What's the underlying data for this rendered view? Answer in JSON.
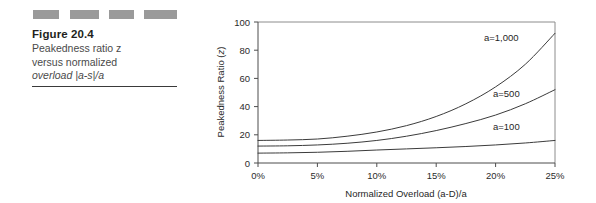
{
  "figure": {
    "redaction_blocks": 4,
    "title": "Figure 20.4",
    "caption_line_1": "Peakedness ratio z",
    "caption_line_2": "versus normalized",
    "caption_line_3": "overload |a-s|/a",
    "caption_full": "Peakedness ratio z versus normalized overload |a-s|/a",
    "rule_color": "#3a3a3a",
    "redaction_color": "#9a9a9a"
  },
  "chart_data": {
    "type": "line",
    "title": "",
    "xlabel": "Normalized Overload (a-D)/a",
    "ylabel": "Peakedness Ratio (z)",
    "ylabel_prefix": "Peakedness Ratio (",
    "ylabel_italic": "z",
    "ylabel_suffix": ")",
    "xlim": [
      0,
      25
    ],
    "ylim": [
      0,
      100
    ],
    "xticks": [
      0,
      5,
      10,
      15,
      20,
      25
    ],
    "xticklabels": [
      "0%",
      "5%",
      "10%",
      "15%",
      "20%",
      "25%"
    ],
    "yticks": [
      0,
      20,
      40,
      60,
      80,
      100
    ],
    "yticklabels": [
      "0",
      "20",
      "40",
      "60",
      "80",
      "100"
    ],
    "grid": false,
    "legend": "inline-annotations",
    "line_color": "#3b3b3b",
    "x": [
      0,
      2.5,
      5,
      7.5,
      10,
      12.5,
      15,
      17.5,
      20,
      22.5,
      25
    ],
    "series": [
      {
        "name": "a=1,000",
        "label": "a=1,000",
        "label_x": 19.0,
        "label_y": 85,
        "values": [
          16,
          16.3,
          17,
          19,
          22,
          26.5,
          33,
          42,
          54,
          70,
          92
        ]
      },
      {
        "name": "a=500",
        "label": "a=500",
        "label_x": 19.5,
        "label_y": 46,
        "values": [
          12,
          12.2,
          12.8,
          14,
          16,
          19,
          23,
          28,
          34,
          42,
          52
        ]
      },
      {
        "name": "a=100",
        "label": "a=100",
        "label_x": 19.5,
        "label_y": 23,
        "values": [
          7,
          7.2,
          7.6,
          8.3,
          9.2,
          10.0,
          10.8,
          11.7,
          12.8,
          14.2,
          16
        ]
      }
    ]
  }
}
